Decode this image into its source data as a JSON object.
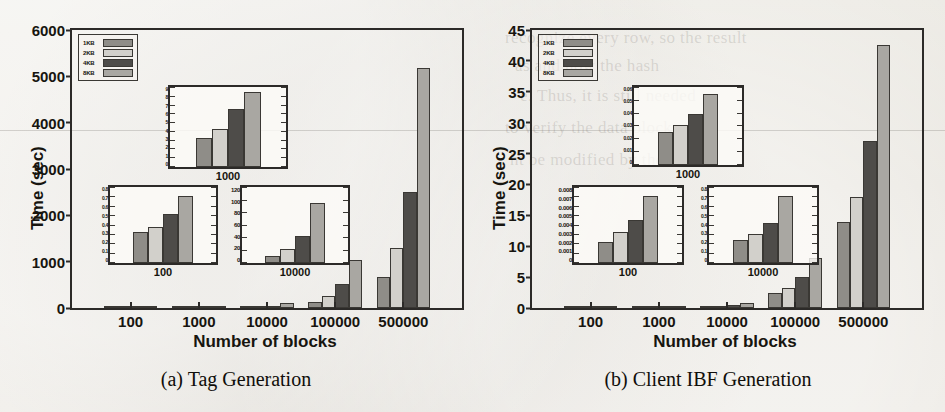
{
  "figure": {
    "background_color": "#e8e6e0",
    "ghost_page_text": [
      "recognize every row, so the result",
      "as and how the hash",
      "e. Thus, it is still needed",
      "to verify the data blocks that",
      "ht be modified by the server."
    ]
  },
  "series_colors": {
    "1KB": "#8f8d88",
    "2KB": "#d2d0cb",
    "4KB": "#4e4c49",
    "8KB": "#a9a7a2"
  },
  "panels": [
    {
      "id": "tag-generation",
      "caption": "(a) Tag Generation",
      "legend": [
        "1KB",
        "2KB",
        "4KB",
        "8KB"
      ],
      "chart_data": {
        "type": "bar",
        "title": "(a) Tag Generation",
        "xlabel": "Number of blocks",
        "ylabel": "Time (sec)",
        "categories": [
          "100",
          "1000",
          "10000",
          "100000",
          "500000"
        ],
        "ylim": [
          0,
          6000
        ],
        "yticks": [
          0,
          1000,
          2000,
          3000,
          4000,
          5000,
          6000
        ],
        "grid": false,
        "legend_position": "upper-left",
        "series": [
          {
            "name": "1KB",
            "values": [
              0.35,
              3.5,
              12,
              125,
              660
            ]
          },
          {
            "name": "2KB",
            "values": [
              0.4,
              4.5,
              24,
              250,
              1300
            ]
          },
          {
            "name": "4KB",
            "values": [
              0.55,
              7,
              46,
              510,
              2500
            ]
          },
          {
            "name": "8KB",
            "values": [
              0.75,
              9,
              100,
              1030,
              5170
            ]
          }
        ],
        "insets": [
          {
            "id": "inset-1000",
            "xlabel": "1000",
            "ylim": [
              0,
              9
            ],
            "yticks": [
              "0",
              "1",
              "2",
              "3",
              "4",
              "5",
              "6",
              "7",
              "8",
              "9"
            ],
            "values": [
              3.5,
              4.5,
              7,
              9
            ]
          },
          {
            "id": "inset-100",
            "xlabel": "100",
            "ylim": [
              0,
              0.8
            ],
            "yticks": [
              "0",
              "0.1",
              "0.2",
              "0.3",
              "0.4",
              "0.5",
              "0.6",
              "0.7",
              "0.8"
            ],
            "values": [
              0.35,
              0.4,
              0.55,
              0.75
            ]
          },
          {
            "id": "inset-10000",
            "xlabel": "10000",
            "ylim": [
              0,
              120
            ],
            "yticks": [
              "0",
              "20",
              "40",
              "60",
              "80",
              "100",
              "120"
            ],
            "values": [
              12,
              24,
              46,
              100
            ]
          }
        ]
      }
    },
    {
      "id": "client-ibf-generation",
      "caption": "(b) Client IBF Generation",
      "legend": [
        "1KB",
        "2KB",
        "4KB",
        "8KB"
      ],
      "chart_data": {
        "type": "bar",
        "title": "(b) Client IBF Generation",
        "xlabel": "Number of blocks",
        "ylabel": "Time (sec)",
        "categories": [
          "100",
          "1000",
          "10000",
          "100000",
          "500000"
        ],
        "ylim": [
          0,
          45
        ],
        "yticks": [
          0,
          5,
          10,
          15,
          20,
          25,
          30,
          35,
          40,
          45
        ],
        "grid": false,
        "legend_position": "upper-left",
        "series": [
          {
            "name": "1KB",
            "values": [
              0.0023,
              0.027,
              0.26,
              2.5,
              14.0
            ]
          },
          {
            "name": "2KB",
            "values": [
              0.0035,
              0.033,
              0.32,
              3.3,
              18.0
            ]
          },
          {
            "name": "4KB",
            "values": [
              0.0048,
              0.042,
              0.45,
              5.1,
              27.0
            ]
          },
          {
            "name": "8KB",
            "values": [
              0.0075,
              0.058,
              0.75,
              8.1,
              42.5
            ]
          }
        ],
        "insets": [
          {
            "id": "inset-1000",
            "xlabel": "1000",
            "ylim": [
              0,
              0.06
            ],
            "yticks": [
              "0",
              "0.01",
              "0.02",
              "0.03",
              "0.04",
              "0.05",
              "0.06"
            ],
            "values": [
              0.027,
              0.033,
              0.042,
              0.058
            ]
          },
          {
            "id": "inset-100",
            "xlabel": "100",
            "ylim": [
              0,
              0.008
            ],
            "yticks": [
              "0",
              "0.001",
              "0.002",
              "0.003",
              "0.004",
              "0.005",
              "0.006",
              "0.007",
              "0.008"
            ],
            "values": [
              0.0023,
              0.0035,
              0.0048,
              0.0075
            ]
          },
          {
            "id": "inset-10000",
            "xlabel": "10000",
            "ylim": [
              0,
              0.8
            ],
            "yticks": [
              "0",
              "0.1",
              "0.2",
              "0.3",
              "0.4",
              "0.5",
              "0.6",
              "0.7",
              "0.8"
            ],
            "values": [
              0.26,
              0.32,
              0.45,
              0.75
            ]
          }
        ]
      }
    }
  ]
}
